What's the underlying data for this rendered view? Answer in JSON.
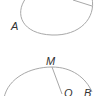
{
  "figures": [
    {
      "id": "circle-top",
      "labels": [
        {
          "name": "A",
          "text": "A"
        }
      ]
    },
    {
      "id": "circle-bottom",
      "labels": [
        {
          "name": "M",
          "text": "M"
        },
        {
          "name": "O",
          "text": "O"
        },
        {
          "name": "B",
          "text": "B"
        }
      ]
    }
  ],
  "colors": {
    "stroke": "#a8a8a8",
    "label": "#333333",
    "background": "#ffffff"
  }
}
